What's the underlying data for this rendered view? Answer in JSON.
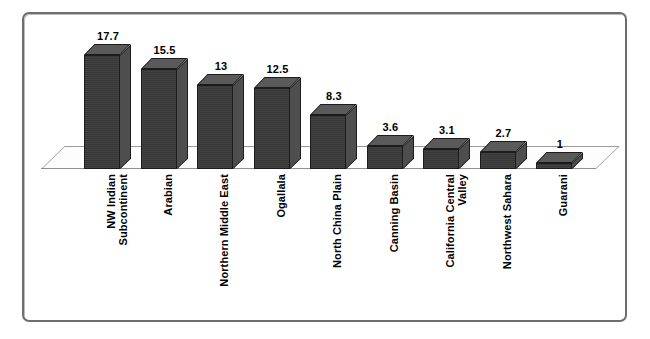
{
  "chart_data": {
    "type": "bar",
    "title": "",
    "subtitle": "",
    "xlabel": "",
    "ylabel": "",
    "ylim": [
      0,
      20
    ],
    "grid": false,
    "legend": false,
    "legend_position": "none",
    "three_d": true,
    "categories": [
      "NW Indian\nSubcontinent",
      "Arabian",
      "Northern Middle East",
      "Ogallala",
      "North China Plain",
      "Canning Basin",
      "California Central\nValley",
      "Northwest Sahara",
      "Guarani"
    ],
    "values": [
      17.7,
      15.5,
      13,
      12.5,
      8.3,
      3.6,
      3.1,
      2.7,
      1
    ],
    "value_labels": [
      "17.7",
      "15.5",
      "13",
      "12.5",
      "8.3",
      "3.6",
      "3.1",
      "2.7",
      "1"
    ],
    "series": [
      {
        "name": "",
        "values": [
          17.7,
          15.5,
          13,
          12.5,
          8.3,
          3.6,
          3.1,
          2.7,
          1
        ]
      }
    ]
  },
  "style": {
    "bar_front_color": "#3a3a3a",
    "bar_side_color": "#4e4e4e",
    "bar_top_color": "#5a5a5a",
    "bar_outline_color": "#1c1c1c",
    "frame_border_color": "#6e6e6e",
    "floor_color": "#fdfdfd",
    "floor_edge_color": "#9a9a9a",
    "background_color": "#ffffff",
    "text_color": "#000000"
  }
}
